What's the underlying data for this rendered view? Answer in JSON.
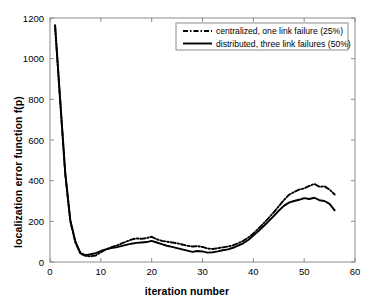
{
  "chart_data": {
    "type": "line",
    "title": "",
    "xlabel": "iteration number",
    "ylabel": "localization error function f(p)",
    "xlim": [
      0,
      60
    ],
    "ylim": [
      0,
      1200
    ],
    "xticks": [
      0,
      10,
      20,
      30,
      40,
      50,
      60
    ],
    "yticks": [
      0,
      200,
      400,
      600,
      800,
      1000,
      1200
    ],
    "grid": false,
    "legend_position": "top-right",
    "series": [
      {
        "name": "centralized, one link failure (25%)",
        "style": "dash-dot",
        "color": "#000000",
        "x": [
          1,
          2,
          3,
          4,
          5,
          6,
          7,
          8,
          9,
          10,
          11,
          12,
          13,
          14,
          15,
          16,
          17,
          18,
          19,
          20,
          21,
          22,
          23,
          24,
          25,
          26,
          27,
          28,
          29,
          30,
          31,
          32,
          33,
          34,
          35,
          36,
          37,
          38,
          39,
          40,
          41,
          42,
          43,
          44,
          45,
          46,
          47,
          48,
          49,
          50,
          51,
          52,
          53,
          54,
          55,
          56
        ],
        "values": [
          1160,
          790,
          430,
          200,
          95,
          40,
          30,
          28,
          32,
          48,
          62,
          72,
          80,
          90,
          100,
          110,
          116,
          114,
          118,
          124,
          112,
          104,
          100,
          96,
          92,
          86,
          80,
          76,
          78,
          74,
          66,
          64,
          68,
          72,
          76,
          82,
          92,
          104,
          120,
          140,
          164,
          190,
          216,
          244,
          274,
          304,
          330,
          344,
          356,
          362,
          374,
          384,
          370,
          372,
          356,
          332
        ]
      },
      {
        "name": "distributed, three link failures (50%)",
        "style": "solid",
        "color": "#000000",
        "x": [
          1,
          2,
          3,
          4,
          5,
          6,
          7,
          8,
          9,
          10,
          11,
          12,
          13,
          14,
          15,
          16,
          17,
          18,
          19,
          20,
          21,
          22,
          23,
          24,
          25,
          26,
          27,
          28,
          29,
          30,
          31,
          32,
          33,
          34,
          35,
          36,
          37,
          38,
          39,
          40,
          41,
          42,
          43,
          44,
          45,
          46,
          47,
          48,
          49,
          50,
          51,
          52,
          53,
          54,
          55,
          56
        ],
        "values": [
          1165,
          800,
          440,
          205,
          100,
          44,
          34,
          38,
          44,
          54,
          62,
          68,
          72,
          78,
          84,
          90,
          94,
          96,
          98,
          104,
          96,
          88,
          80,
          74,
          68,
          62,
          56,
          50,
          54,
          52,
          46,
          48,
          52,
          58,
          62,
          70,
          80,
          92,
          108,
          130,
          152,
          176,
          200,
          226,
          252,
          276,
          292,
          300,
          306,
          314,
          310,
          316,
          304,
          300,
          286,
          254
        ]
      }
    ]
  },
  "legend": {
    "entries": [
      {
        "label": "centralized, one link failure (25%)",
        "style": "dash-dot"
      },
      {
        "label": "distributed, three link failures (50%)",
        "style": "solid"
      }
    ]
  },
  "axes": {
    "xlabel": "iteration number",
    "ylabel": "localization error function f(p)",
    "xtick_labels": [
      "0",
      "10",
      "20",
      "30",
      "40",
      "50",
      "60"
    ],
    "ytick_labels": [
      "0",
      "200",
      "400",
      "600",
      "800",
      "1000",
      "1200"
    ]
  },
  "colors": {
    "line": "#000000",
    "axis": "#8c8c8c",
    "background": "#ffffff"
  }
}
